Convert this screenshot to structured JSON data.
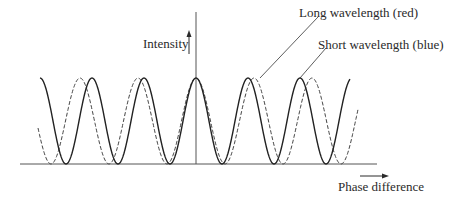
{
  "diagram": {
    "y_axis_label": "Intensity",
    "x_axis_label": "Phase difference",
    "legend": {
      "long": "Long wavelength (red)",
      "short": "Short wavelength (blue)"
    },
    "curves": [
      {
        "name": "long-wavelength",
        "style": "solid",
        "period_px": 52,
        "center_x": 196
      },
      {
        "name": "short-wavelength",
        "style": "dashed",
        "period_px": 58,
        "center_x": 196
      }
    ],
    "colors": {
      "ink": "#2a2a2a",
      "axis": "#555555"
    }
  }
}
